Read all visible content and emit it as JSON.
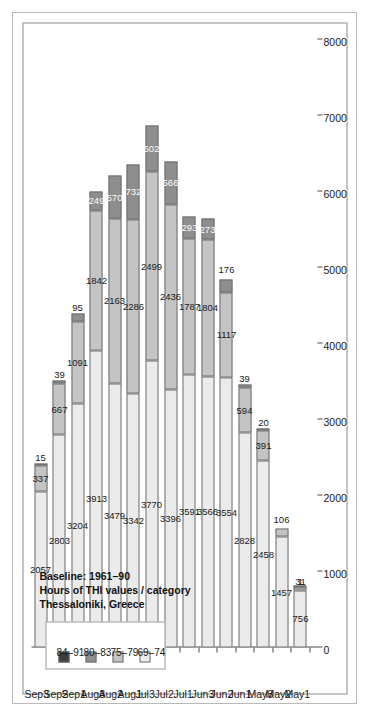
{
  "chart_data": {
    "type": "bar",
    "orientation": "horizontal-stacked-rotated",
    "title": "Thessaloniki, Greece",
    "subtitle": "Hours of THI values / category",
    "baseline": "Baseline: 1961–90",
    "title_lines": [
      "Thessaloniki, Greece",
      "Hours of THI values / category",
      "Baseline: 1961–90"
    ],
    "xlabel": "",
    "ylabel": "",
    "ylim": [
      0,
      8000
    ],
    "ytick_values": [
      0,
      1000,
      2000,
      3000,
      4000,
      5000,
      6000,
      7000,
      8000
    ],
    "ytick_labels": [
      "0",
      "1000",
      "2000",
      "3000",
      "4000",
      "5000",
      "6000",
      "7000",
      "8000"
    ],
    "grid": false,
    "legend_position": "top-left",
    "categories": [
      "May1",
      "May2",
      "May3",
      "Jun1",
      "Jun2",
      "Jun3",
      "Jul1",
      "Jul2",
      "Jul3",
      "Aug1",
      "Aug2",
      "Aug3",
      "Sep1",
      "Sep2",
      "Sep3"
    ],
    "series": [
      {
        "name": "69–74",
        "color": "#ebebeb",
        "values": [
          756,
          1457,
          2458,
          2828,
          3554,
          3566,
          3591,
          3396,
          3770,
          3342,
          3479,
          3913,
          3204,
          2803,
          2057
        ]
      },
      {
        "name": "75–79",
        "color": "#c4c4c4",
        "values": [
          31,
          106,
          391,
          594,
          1117,
          1804,
          1787,
          2436,
          2499,
          2286,
          2163,
          1842,
          1091,
          667,
          337
        ]
      },
      {
        "name": "80–83",
        "color": "#8e8e8e",
        "values": [
          1,
          0,
          20,
          39,
          176,
          273,
          293,
          566,
          602,
          732,
          570,
          249,
          95,
          39,
          15
        ]
      },
      {
        "name": "84–91",
        "color": "#3d3d3d",
        "values": [
          0,
          0,
          0,
          0,
          0,
          0,
          0,
          0,
          0,
          0,
          0,
          0,
          0,
          0,
          0
        ]
      }
    ]
  },
  "legend": {
    "items": [
      {
        "label": "84–91",
        "color": "#3d3d3d"
      },
      {
        "label": "80–83",
        "color": "#8e8e8e"
      },
      {
        "label": "75–79",
        "color": "#c4c4c4"
      },
      {
        "label": "69–74",
        "color": "#ebebeb"
      }
    ]
  }
}
